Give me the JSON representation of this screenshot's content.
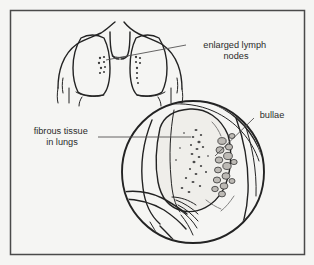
{
  "figure": {
    "background_color": "#f4f4f2",
    "ink_color": "#232323",
    "frame_color": "#4a4a4a",
    "leader_color": "#555453",
    "text_color": "#2b2b2b"
  },
  "labels": {
    "lymph_nodes": {
      "line1": "enlarged lymph",
      "line2": "nodes"
    },
    "fibrous_tissue": {
      "line1": "fibrous tissue",
      "line2": "in lungs"
    },
    "bullae": {
      "line1": "bullae"
    }
  },
  "panels": {
    "thorax": {
      "name": "thorax-lungs-outline",
      "description": "front view of chest with both lungs and hilar lymph nodes"
    },
    "inset": {
      "name": "magnified-lung-circle",
      "description": "circular magnified view of lung showing bullae and fibrous tissue",
      "center_x": 193,
      "center_y": 172,
      "radius": 71
    }
  }
}
